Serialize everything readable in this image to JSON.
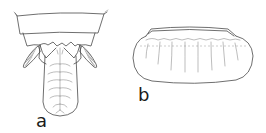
{
  "figure": {
    "type": "scientific-line-drawing",
    "panels": [
      {
        "id": "a",
        "label": "a",
        "subject": "terminal abdominal segments with tongue-shaped plate and paired lateral appendages"
      },
      {
        "id": "b",
        "label": "b",
        "subject": "oval ribbed body in lateral view"
      }
    ]
  },
  "colors": {
    "ink": "#4a4a4a",
    "background": "#ffffff"
  }
}
